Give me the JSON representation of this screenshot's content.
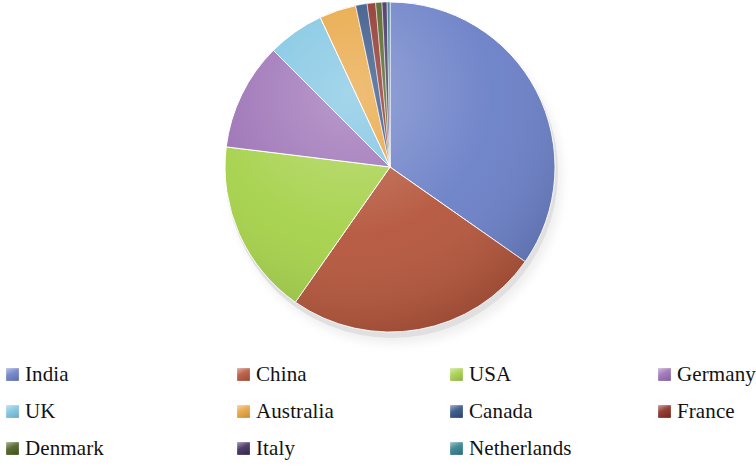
{
  "chart_data": {
    "type": "pie",
    "title": "",
    "subtitle": "",
    "xlabel": "",
    "ylabel": "",
    "grid": false,
    "legend_position": "bottom",
    "start_angle_deg": 0,
    "direction": "clockwise",
    "labels": [
      "India",
      "China",
      "USA",
      "Germany",
      "UK",
      "Australia",
      "Canada",
      "France",
      "Denmark",
      "Italy",
      "Netherlands"
    ],
    "values": [
      34.7,
      25.0,
      17.2,
      10.6,
      5.6,
      3.6,
      1.1,
      0.8,
      0.6,
      0.5,
      0.3
    ],
    "angles_deg": [
      125.0,
      90.0,
      62.0,
      38.0,
      20.0,
      13.0,
      4.0,
      3.0,
      2.2,
      1.8,
      1.0
    ],
    "colors": [
      "#6b7fc7",
      "#b5553b",
      "#a5d14a",
      "#9b6fb5",
      "#7dc4e2",
      "#e8a33d",
      "#2f4f82",
      "#8a2a20",
      "#4a5c1e",
      "#3d2a5c",
      "#2f7f8c"
    ],
    "slices": [
      {
        "label": "India",
        "value": 34.7,
        "angle_deg": 125.0,
        "color": "#6b7fc7"
      },
      {
        "label": "China",
        "value": 25.0,
        "angle_deg": 90.0,
        "color": "#b5553b"
      },
      {
        "label": "USA",
        "value": 17.2,
        "angle_deg": 62.0,
        "color": "#a5d14a"
      },
      {
        "label": "Germany",
        "value": 10.6,
        "angle_deg": 38.0,
        "color": "#9b6fb5"
      },
      {
        "label": "UK",
        "value": 5.6,
        "angle_deg": 20.0,
        "color": "#7dc4e2"
      },
      {
        "label": "Australia",
        "value": 3.6,
        "angle_deg": 13.0,
        "color": "#e8a33d"
      },
      {
        "label": "Canada",
        "value": 1.1,
        "angle_deg": 4.0,
        "color": "#2f4f82"
      },
      {
        "label": "France",
        "value": 0.8,
        "angle_deg": 3.0,
        "color": "#8a2a20"
      },
      {
        "label": "Denmark",
        "value": 0.6,
        "angle_deg": 2.2,
        "color": "#4a5c1e"
      },
      {
        "label": "Italy",
        "value": 0.5,
        "angle_deg": 1.8,
        "color": "#3d2a5c"
      },
      {
        "label": "Netherlands",
        "value": 0.3,
        "angle_deg": 1.0,
        "color": "#2f7f8c"
      }
    ]
  },
  "legend": {
    "rows": [
      [
        {
          "label": "India",
          "color": "#6b7fc7"
        },
        {
          "label": "China",
          "color": "#b5553b"
        },
        {
          "label": "USA",
          "color": "#a5d14a"
        },
        {
          "label": "Germany",
          "color": "#9b6fb5"
        }
      ],
      [
        {
          "label": "UK",
          "color": "#7dc4e2"
        },
        {
          "label": "Australia",
          "color": "#e8a33d"
        },
        {
          "label": "Canada",
          "color": "#2f4f82"
        },
        {
          "label": "France",
          "color": "#8a2a20"
        }
      ],
      [
        {
          "label": "Denmark",
          "color": "#4a5c1e"
        },
        {
          "label": "Italy",
          "color": "#3d2a5c"
        },
        {
          "label": "Netherlands",
          "color": "#2f7f8c"
        },
        {
          "label": "",
          "color": ""
        }
      ]
    ]
  }
}
